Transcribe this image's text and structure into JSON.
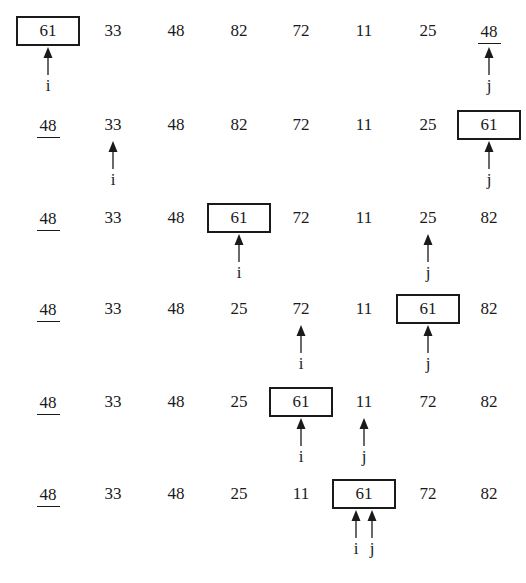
{
  "diagram": {
    "title": "",
    "column_x": [
      48,
      113,
      176,
      239,
      301,
      364,
      428,
      489
    ],
    "row_y": [
      16,
      110,
      203,
      294,
      387,
      479
    ],
    "rows": [
      {
        "values": [
          "61",
          "33",
          "48",
          "82",
          "72",
          "11",
          "25",
          "48"
        ],
        "boxed_index": 0,
        "underlined_index": 7,
        "pointers": [
          {
            "label": "i",
            "index": 0,
            "offset": 0
          },
          {
            "label": "j",
            "index": 7,
            "offset": 0
          }
        ]
      },
      {
        "values": [
          "48",
          "33",
          "48",
          "82",
          "72",
          "11",
          "25",
          "61"
        ],
        "boxed_index": 7,
        "underlined_index": 0,
        "pointers": [
          {
            "label": "i",
            "index": 1,
            "offset": 0
          },
          {
            "label": "j",
            "index": 7,
            "offset": 0
          }
        ]
      },
      {
        "values": [
          "48",
          "33",
          "48",
          "61",
          "72",
          "11",
          "25",
          "82"
        ],
        "boxed_index": 3,
        "underlined_index": 0,
        "pointers": [
          {
            "label": "i",
            "index": 3,
            "offset": 0
          },
          {
            "label": "j",
            "index": 6,
            "offset": 0
          }
        ]
      },
      {
        "values": [
          "48",
          "33",
          "48",
          "25",
          "72",
          "11",
          "61",
          "82"
        ],
        "boxed_index": 6,
        "underlined_index": 0,
        "pointers": [
          {
            "label": "i",
            "index": 4,
            "offset": 0
          },
          {
            "label": "j",
            "index": 6,
            "offset": 0
          }
        ]
      },
      {
        "values": [
          "48",
          "33",
          "48",
          "25",
          "61",
          "11",
          "72",
          "82"
        ],
        "boxed_index": 4,
        "underlined_index": 0,
        "pointers": [
          {
            "label": "i",
            "index": 4,
            "offset": 0
          },
          {
            "label": "j",
            "index": 5,
            "offset": 0
          }
        ]
      },
      {
        "values": [
          "48",
          "33",
          "48",
          "25",
          "11",
          "61",
          "72",
          "82"
        ],
        "boxed_index": 5,
        "underlined_index": 0,
        "pointers": [
          {
            "label": "i",
            "index": 5,
            "offset": -8
          },
          {
            "label": "j",
            "index": 5,
            "offset": 8
          }
        ]
      }
    ],
    "colors": {
      "ink": "#1a1a1a",
      "background": "#ffffff"
    }
  }
}
